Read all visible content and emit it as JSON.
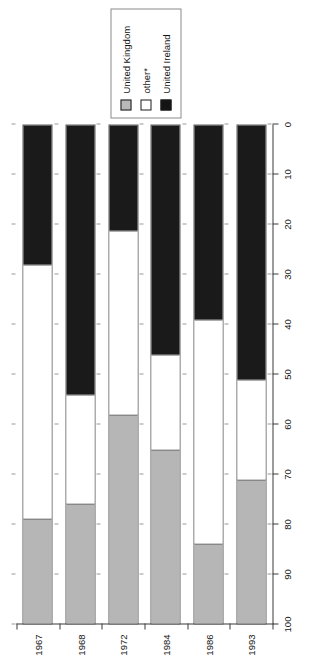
{
  "chart_data": {
    "type": "bar",
    "orientation": "horizontal-stacked-rotated",
    "title": "",
    "xlabel": "",
    "ylabel": "",
    "categories": [
      "1967",
      "1968",
      "1972",
      "1984",
      "1986",
      "1993"
    ],
    "series": [
      {
        "name": "United Kingdom",
        "color": "#b6b6b6",
        "values": [
          21,
          24,
          42,
          35,
          16,
          29
        ]
      },
      {
        "name": "other*",
        "color": "#ffffff",
        "values": [
          51,
          22,
          37,
          19,
          45,
          20
        ]
      },
      {
        "name": "United Ireland",
        "color": "#1a1a1a",
        "values": [
          28,
          54,
          21,
          46,
          39,
          51
        ]
      }
    ],
    "value_axis": {
      "min": 0,
      "max": 100,
      "ticks": [
        100,
        90,
        80,
        70,
        60,
        50,
        40,
        30,
        20,
        10,
        0
      ],
      "direction": "descending-left-to-right"
    },
    "legend": {
      "position": "top",
      "entries": [
        {
          "label": "United Kingdom",
          "swatch": "gray"
        },
        {
          "label": "other*",
          "swatch": "white"
        },
        {
          "label": "United Ireland",
          "swatch": "black"
        }
      ]
    },
    "grid": "dotted-minor"
  }
}
